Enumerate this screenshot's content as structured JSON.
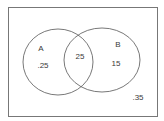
{
  "diagram": {
    "type": "venn",
    "sets": [
      {
        "label": "A",
        "only_value": ".25"
      },
      {
        "label": "B",
        "only_value": "15"
      }
    ],
    "intersection_value": "25",
    "outside_value": ".35",
    "colors": {
      "stroke": "#555555",
      "frame": "#777777",
      "text": "#3a3a3a",
      "background": "#ffffff"
    }
  }
}
